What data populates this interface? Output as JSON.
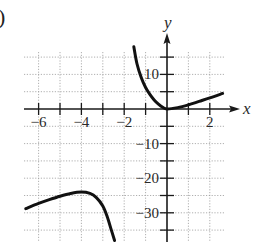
{
  "part_label": ")",
  "chart_data": {
    "type": "line",
    "title": "",
    "xlabel": "x",
    "ylabel": "y",
    "xlim": [
      -6.6,
      2.6
    ],
    "ylim": [
      -38,
      18
    ],
    "x_ticks": [
      -6,
      -5,
      -4,
      -3,
      -2,
      -1,
      0,
      1,
      2
    ],
    "x_tick_labels": [
      "-6",
      "-4",
      "-2",
      "2"
    ],
    "y_ticks": [
      15,
      10,
      5,
      0,
      -5,
      -10,
      -15,
      -20,
      -25,
      -30,
      -35
    ],
    "y_tick_labels": [
      "10",
      "-10",
      "-20",
      "-30"
    ],
    "grid": true,
    "series": [
      {
        "name": "right-branch",
        "x": [
          -1.55,
          -1.4,
          -1.2,
          -1.0,
          -0.8,
          -0.6,
          -0.4,
          -0.2,
          0,
          0.5,
          1.0,
          1.5,
          2.0,
          2.6
        ],
        "y": [
          18,
          13,
          9,
          6.2,
          4.2,
          2.6,
          1.4,
          0.5,
          0,
          0.4,
          1.2,
          2.2,
          3.2,
          4.5
        ]
      },
      {
        "name": "left-branch",
        "x": [
          -6.6,
          -6.0,
          -5.5,
          -5.0,
          -4.5,
          -4.0,
          -3.6,
          -3.3,
          -3.0,
          -2.8,
          -2.6,
          -2.45
        ],
        "y": [
          -28.8,
          -27.3,
          -26.2,
          -25.2,
          -24.4,
          -24.0,
          -24.4,
          -25.6,
          -28.0,
          -31.0,
          -35.0,
          -38.0
        ]
      }
    ]
  },
  "axes": {
    "x_label": "x",
    "y_label": "y",
    "x_tick_text": [
      "−6",
      "−4",
      "−2",
      "2"
    ],
    "y_tick_text": [
      "10",
      "−10",
      "−20",
      "−30"
    ]
  }
}
